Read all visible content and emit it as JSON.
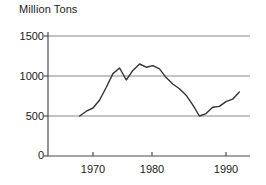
{
  "chart_data": {
    "type": "line",
    "title": "",
    "ylabel": "Million Tons",
    "xlabel": "",
    "ylim": [
      0,
      1600
    ],
    "xlim": [
      1967,
      1993
    ],
    "yticks": [
      0,
      500,
      1000,
      1500
    ],
    "ytick_labels": [
      "0",
      "500",
      "1000",
      "1500"
    ],
    "xticks": [
      1970,
      1980,
      1990
    ],
    "xtick_labels": [
      "1970",
      "1980",
      "1990"
    ],
    "grid": "horizontal",
    "legend": "none",
    "line_color": "#333333",
    "grid_color": "#888888",
    "axis_color": "#555555",
    "series": [
      {
        "name": "Million Tons",
        "x": [
          1968,
          1969,
          1970,
          1971,
          1972,
          1973,
          1974,
          1975,
          1976,
          1977,
          1978,
          1979,
          1980,
          1981,
          1982,
          1983,
          1984,
          1985,
          1986,
          1987,
          1988,
          1989,
          1990,
          1991,
          1992
        ],
        "values": [
          500,
          560,
          600,
          700,
          860,
          1030,
          1100,
          950,
          1070,
          1150,
          1110,
          1130,
          1090,
          980,
          900,
          840,
          760,
          640,
          500,
          530,
          610,
          620,
          680,
          710,
          800
        ]
      }
    ]
  },
  "axis_labels": {
    "y": [
      "1500",
      "1000",
      "500",
      "0"
    ],
    "x": [
      "1970",
      "1980",
      "1990"
    ]
  }
}
